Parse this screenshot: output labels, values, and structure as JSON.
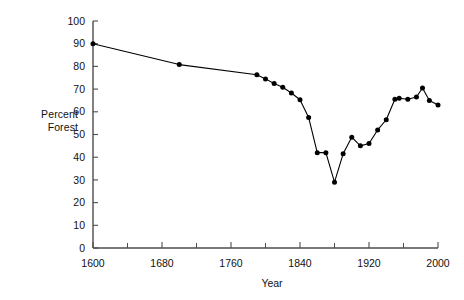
{
  "chart_data": {
    "type": "line",
    "title": "",
    "xlabel": "Year",
    "ylabel": "Percent Forest",
    "ylabel_lines": [
      "Percent",
      "Forest"
    ],
    "xlim": [
      1600,
      2000
    ],
    "ylim": [
      0,
      100
    ],
    "xticks": [
      1600,
      1680,
      1760,
      1840,
      1920,
      2000
    ],
    "xtick_labels": [
      "1600",
      "1680",
      "1760",
      "1840",
      "1920",
      "2000"
    ],
    "x_minor_ticks": [
      1640,
      1720,
      1800,
      1880,
      1960
    ],
    "yticks": [
      0,
      10,
      20,
      30,
      40,
      50,
      60,
      70,
      80,
      90,
      100
    ],
    "ytick_labels": [
      "0",
      "10",
      "20",
      "30",
      "40",
      "50",
      "60",
      "70",
      "80",
      "90",
      "100"
    ],
    "grid": false,
    "legend": null,
    "marker": "filled-circle",
    "line_color": "#000000",
    "marker_color": "#000000",
    "axis_color": "#4d4d4d",
    "series": [
      {
        "name": "Percent Forest",
        "points": [
          {
            "x": 1600,
            "y": 90.0
          },
          {
            "x": 1700,
            "y": 80.8
          },
          {
            "x": 1790,
            "y": 76.3
          },
          {
            "x": 1800,
            "y": 74.5
          },
          {
            "x": 1810,
            "y": 72.5
          },
          {
            "x": 1820,
            "y": 70.8
          },
          {
            "x": 1830,
            "y": 68.3
          },
          {
            "x": 1840,
            "y": 65.3
          },
          {
            "x": 1850,
            "y": 57.5
          },
          {
            "x": 1860,
            "y": 42.0
          },
          {
            "x": 1870,
            "y": 42.0
          },
          {
            "x": 1880,
            "y": 29.0
          },
          {
            "x": 1890,
            "y": 41.5
          },
          {
            "x": 1900,
            "y": 48.8
          },
          {
            "x": 1910,
            "y": 45.0
          },
          {
            "x": 1920,
            "y": 46.0
          },
          {
            "x": 1930,
            "y": 52.0
          },
          {
            "x": 1940,
            "y": 56.5
          },
          {
            "x": 1950,
            "y": 65.5
          },
          {
            "x": 1955,
            "y": 66.0
          },
          {
            "x": 1965,
            "y": 65.5
          },
          {
            "x": 1975,
            "y": 66.5
          },
          {
            "x": 1982,
            "y": 70.5
          },
          {
            "x": 1990,
            "y": 65.0
          },
          {
            "x": 2000,
            "y": 63.0
          }
        ]
      }
    ]
  }
}
